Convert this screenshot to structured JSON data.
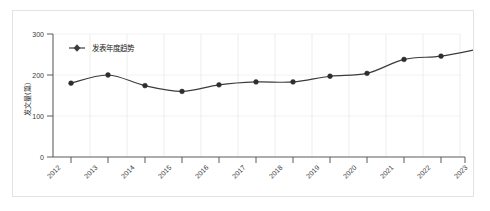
{
  "panel": {
    "border_color": "#e3e3e3",
    "background": "#ffffff"
  },
  "chart_data": {
    "type": "line",
    "title": "",
    "subtitle": "",
    "xlabel": "",
    "ylabel": "发文量(篇)",
    "categories": [
      "2012",
      "2013",
      "2014",
      "2015",
      "2016",
      "2017",
      "2018",
      "2019",
      "2020",
      "2021",
      "2022",
      "2023"
    ],
    "series": [
      {
        "name": "发表年度趋势",
        "values": [
          180,
          200,
          174,
          160,
          176,
          183,
          183,
          197,
          204,
          238,
          246,
          263
        ],
        "color": "#3c3c3c",
        "marker": "circle",
        "smooth": true
      }
    ],
    "ylim": [
      0,
      300
    ],
    "yticks": [
      0,
      100,
      200,
      300
    ],
    "ytick_labels": [
      "0",
      "100",
      "200",
      "300"
    ],
    "grid": {
      "vertical": true,
      "horizontal": true,
      "vertical_color": "#e8e8e8",
      "horizontal_color": "#f0f0f0"
    },
    "legend": {
      "position": "top-left",
      "entries": [
        {
          "label": "发表年度趋势",
          "color": "#3c3c3c",
          "marker": "diamond-line"
        }
      ]
    },
    "xtick_rotation": -45
  },
  "axis": {
    "y_label": "发文量(篇)",
    "y_ticks": [
      "0",
      "100",
      "200",
      "300"
    ],
    "x_ticks": [
      "2012",
      "2013",
      "2014",
      "2015",
      "2016",
      "2017",
      "2018",
      "2019",
      "2020",
      "2021",
      "2022",
      "2023"
    ]
  },
  "legend": {
    "entry_label": "发表年度趋势"
  }
}
